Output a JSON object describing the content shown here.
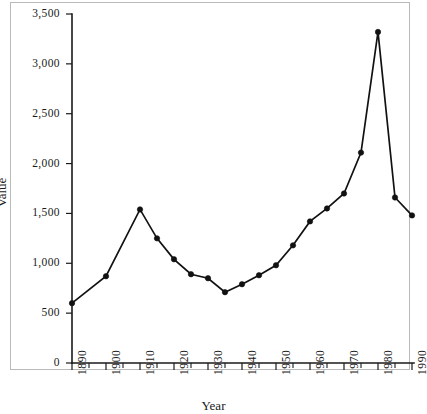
{
  "chart_data": {
    "type": "line",
    "title": "",
    "xlabel": "Year",
    "ylabel": "Value",
    "xlim": [
      1890,
      1990
    ],
    "ylim": [
      0,
      3500
    ],
    "grid": false,
    "legend": null,
    "y_ticks": [
      0,
      500,
      1000,
      1500,
      2000,
      2500,
      3000,
      3500
    ],
    "y_tick_labels": [
      "0",
      "500",
      "1,000",
      "1,500",
      "2,000",
      "2,500",
      "3,000",
      "3,500"
    ],
    "x_ticks": [
      1890,
      1895,
      1900,
      1905,
      1910,
      1915,
      1920,
      1925,
      1930,
      1935,
      1940,
      1945,
      1950,
      1955,
      1960,
      1965,
      1970,
      1975,
      1980,
      1985,
      1990
    ],
    "x_tick_labels": [
      "1890",
      "",
      "1900",
      "",
      "1910",
      "",
      "1920",
      "",
      "1930",
      "",
      "1940",
      "",
      "1950",
      "",
      "1960",
      "",
      "1970",
      "",
      "1980",
      "",
      "1990"
    ],
    "x_major_labels": [
      "1890",
      "1900",
      "1910",
      "1920",
      "1930",
      "1940",
      "1950",
      "1960",
      "1970",
      "1980",
      "1990"
    ],
    "x": [
      1890,
      1900,
      1910,
      1915,
      1920,
      1925,
      1930,
      1935,
      1940,
      1945,
      1950,
      1955,
      1960,
      1965,
      1970,
      1975,
      1980,
      1985,
      1990
    ],
    "values": [
      600,
      870,
      1540,
      1250,
      1040,
      890,
      850,
      710,
      790,
      880,
      980,
      1180,
      1420,
      1550,
      1700,
      2110,
      3320,
      1660,
      1480
    ],
    "marker": "circle",
    "line_color": "#111111",
    "marker_color": "#111111",
    "background": "#ffffff"
  }
}
